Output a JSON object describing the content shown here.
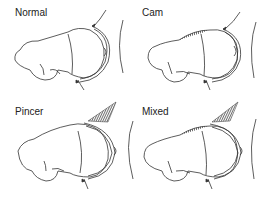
{
  "figure": {
    "panels": [
      {
        "label": "Normal",
        "cam": false,
        "pincer": false
      },
      {
        "label": "Cam",
        "cam": true,
        "pincer": false
      },
      {
        "label": "Pincer",
        "cam": false,
        "pincer": true
      },
      {
        "label": "Mixed",
        "cam": true,
        "pincer": true
      }
    ]
  },
  "colors": {
    "stroke": "#333333",
    "background": "#ffffff"
  }
}
